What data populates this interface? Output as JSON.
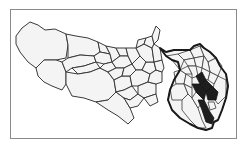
{
  "map": {
    "title": "Tokyo Metropolis municipalities",
    "regions": {
      "tama": "Tama area municipalities",
      "wards": "Special wards (thick outline)",
      "highlighted": "Highlighted wards (dark fill)"
    },
    "colors": {
      "land": "#f4f4f4",
      "border": "#3a3a3a",
      "ward_outline": "#1a1a1a",
      "highlight": "#1e1e1e",
      "frame": "#8a8a8a"
    }
  }
}
